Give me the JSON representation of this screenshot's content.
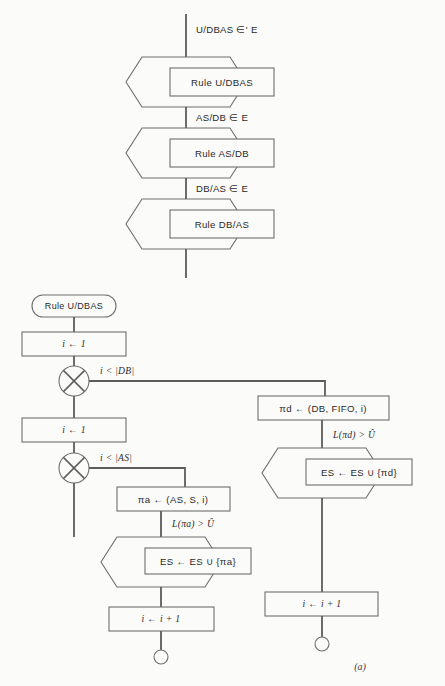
{
  "figure": {
    "caption": "(a)",
    "background_color": "#fbfbfa",
    "line_color": "#6e6e6e",
    "text_color": "#2a2a2a"
  },
  "top_chart": {
    "entry_label": "U/DBAS ∈' E",
    "stages": [
      {
        "process_label": "Rule U/DBAS",
        "exit_label": "AS/DB ∈ E"
      },
      {
        "process_label": "Rule AS/DB",
        "exit_label": "DB/AS ∈ E"
      },
      {
        "process_label": "Rule DB/AS",
        "exit_label": ""
      }
    ]
  },
  "bottom_chart": {
    "start_label": "Rule U/DBAS",
    "init_outer_label": "i ← 1",
    "decision_outer_label": "i < |DB|",
    "init_inner_label": "i ← 1",
    "decision_inner_label": "i < |AS|",
    "left_branch": {
      "assign_label": "πa ← (AS, S, i)",
      "condition_label": "L(πa) > Û",
      "action_label": "ES ← ES ∪ {πa}",
      "increment_label": "i ← i + 1"
    },
    "right_branch": {
      "assign_label": "πd ← (DB, FIFO, i)",
      "condition_label": "L(πd) > Û",
      "action_label": "ES ← ES ∪ {πd}",
      "increment_label": "i ← i + 1"
    }
  }
}
